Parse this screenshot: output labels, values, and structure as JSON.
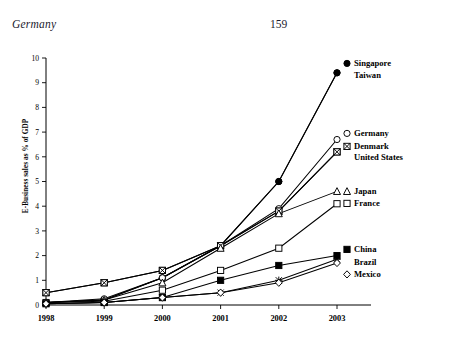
{
  "running_head": {
    "title": "Germany",
    "page_number": "159"
  },
  "chart_data": {
    "type": "line",
    "title": "",
    "xlabel": "",
    "ylabel": "E-Business sales as % of GDP",
    "categories": [
      "1998",
      "1999",
      "2000",
      "2001",
      "2002",
      "2003"
    ],
    "x": [
      1998,
      1999,
      2000,
      2001,
      2002,
      2003
    ],
    "ylim": [
      0,
      10
    ],
    "xlim": [
      1998,
      2003
    ],
    "yticks": [
      "0",
      "1",
      "2",
      "3",
      "4",
      "5",
      "6",
      "7",
      "8",
      "9",
      "10"
    ],
    "grid": false,
    "legend_position": "right-inline-end-of-line",
    "series": [
      {
        "name": "Singapore",
        "marker": "filled-circle",
        "values": [
          0.1,
          0.2,
          1.1,
          2.4,
          5.0,
          9.4
        ]
      },
      {
        "name": "Taiwan",
        "marker": "filled-circle",
        "values": [
          0.1,
          0.2,
          1.1,
          2.4,
          5.0,
          9.4
        ]
      },
      {
        "name": "Germany",
        "marker": "open-circle",
        "values": [
          0.1,
          0.25,
          1.1,
          2.4,
          3.9,
          6.7
        ]
      },
      {
        "name": "Denmark",
        "marker": "x-in-square",
        "values": [
          0.5,
          0.9,
          1.4,
          2.4,
          3.8,
          6.2
        ]
      },
      {
        "name": "United States",
        "marker": "x-in-square",
        "values": [
          0.5,
          0.9,
          1.4,
          2.4,
          3.8,
          6.2
        ]
      },
      {
        "name": "Japan",
        "marker": "open-triangle",
        "values": [
          0.1,
          0.2,
          0.9,
          2.3,
          3.7,
          4.6
        ]
      },
      {
        "name": "France",
        "marker": "open-square",
        "values": [
          0.1,
          0.15,
          0.6,
          1.4,
          2.3,
          4.1
        ]
      },
      {
        "name": "China",
        "marker": "filled-square",
        "values": [
          0.05,
          0.1,
          0.3,
          1.0,
          1.6,
          2.0
        ]
      },
      {
        "name": "Brazil",
        "marker": "cross",
        "values": [
          0.05,
          0.1,
          0.3,
          0.5,
          1.0,
          1.85
        ]
      },
      {
        "name": "Mexico",
        "marker": "open-diamond",
        "values": [
          0.05,
          0.1,
          0.3,
          0.5,
          0.9,
          1.7
        ]
      }
    ],
    "legend_labels": [
      {
        "label": "Singapore",
        "marker": "filled-circle"
      },
      {
        "label": "Taiwan",
        "marker": "none"
      },
      {
        "label": "Germany",
        "marker": "open-circle"
      },
      {
        "label": "Denmark",
        "marker": "x-in-square"
      },
      {
        "label": "United States",
        "marker": "none"
      },
      {
        "label": "Japan",
        "marker": "open-triangle"
      },
      {
        "label": "France",
        "marker": "open-square"
      },
      {
        "label": "China",
        "marker": "filled-square"
      },
      {
        "label": "Brazil",
        "marker": "none"
      },
      {
        "label": "Mexico",
        "marker": "open-diamond"
      }
    ]
  },
  "caption": ""
}
